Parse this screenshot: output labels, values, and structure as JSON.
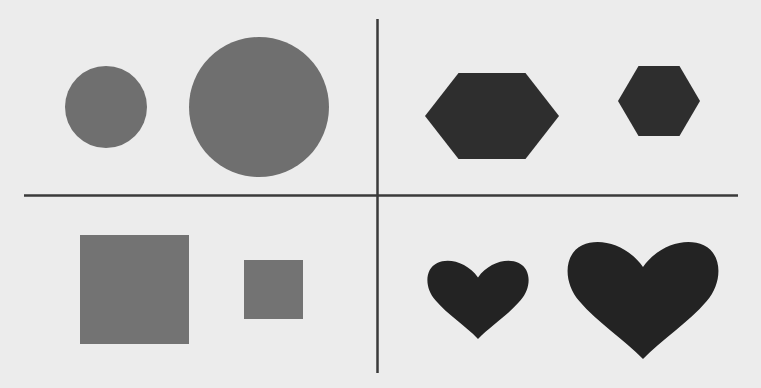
{
  "figure": {
    "background": "#ececec",
    "divider_color": "#3a3a3a",
    "quadrants": [
      {
        "id": "top-left",
        "shape": "circle",
        "color": "#6f6f6f",
        "items": [
          {
            "size": "small",
            "cx": 106,
            "cy": 107,
            "r": 41
          },
          {
            "size": "large",
            "cx": 259,
            "cy": 107,
            "r": 70
          }
        ]
      },
      {
        "id": "top-right",
        "shape": "hexagon",
        "color": "#2e2e2e",
        "items": [
          {
            "size": "large",
            "cx": 492,
            "cy": 116,
            "rx": 67,
            "ry": 43
          },
          {
            "size": "small",
            "cx": 659,
            "cy": 101,
            "rx": 41,
            "ry": 35
          }
        ]
      },
      {
        "id": "bottom-left",
        "shape": "square",
        "color": "#737373",
        "items": [
          {
            "size": "large",
            "x": 80,
            "y": 235,
            "w": 109,
            "h": 109
          },
          {
            "size": "small",
            "x": 244,
            "y": 260,
            "w": 59,
            "h": 59
          }
        ]
      },
      {
        "id": "bottom-right",
        "shape": "heart",
        "color": "#232323",
        "items": [
          {
            "size": "small",
            "x": 427,
            "y": 258,
            "w": 102,
            "h": 81
          },
          {
            "size": "large",
            "x": 567,
            "y": 238,
            "w": 152,
            "h": 121
          }
        ]
      }
    ]
  }
}
